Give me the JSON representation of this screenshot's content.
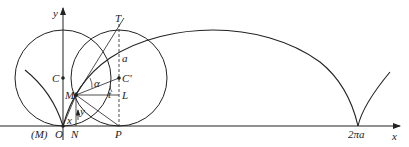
{
  "figure": {
    "labels": {
      "y_axis": "y",
      "x_axis": "x",
      "T": "T",
      "a_top": "a",
      "C": "C",
      "C_prime": "C'",
      "alpha": "α",
      "M_prime": "M'",
      "t": "t",
      "L": "L",
      "y_seg": "y",
      "x_seg": "x",
      "M_origin": "(M)",
      "O": "O",
      "N": "N",
      "P": "P",
      "two_pi_a": "2πa"
    },
    "colors": {
      "stroke": "#222222",
      "background": "#ffffff"
    }
  }
}
